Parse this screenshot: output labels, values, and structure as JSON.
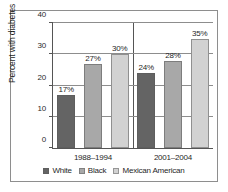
{
  "chart_data": {
    "type": "bar",
    "title": "",
    "xlabel": "",
    "ylabel": "Percent with diabetes",
    "categories": [
      "1988–1994",
      "2001–2004"
    ],
    "series": [
      {
        "name": "White",
        "color": "#646464",
        "values": [
          17,
          24
        ],
        "labels": [
          "17%",
          "24%"
        ]
      },
      {
        "name": "Black",
        "color": "#a8a8a8",
        "values": [
          27,
          28
        ],
        "labels": [
          "27%",
          "28%"
        ]
      },
      {
        "name": "Mexican American",
        "color": "#d2d2d2",
        "values": [
          30,
          35
        ],
        "labels": [
          "30%",
          "35%"
        ]
      }
    ],
    "ylim": [
      0,
      40
    ],
    "yticks": [
      0,
      10,
      20,
      30,
      40
    ],
    "ytick_labels": [
      "0",
      "10",
      "20",
      "30",
      "40"
    ],
    "grid": true,
    "legend_position": "bottom",
    "value_suffix": "%"
  },
  "legend": {
    "items": [
      {
        "label": "White"
      },
      {
        "label": "Black"
      },
      {
        "label": "Mexican American"
      }
    ]
  },
  "axes": {
    "y_title": "Percent with diabetes"
  }
}
